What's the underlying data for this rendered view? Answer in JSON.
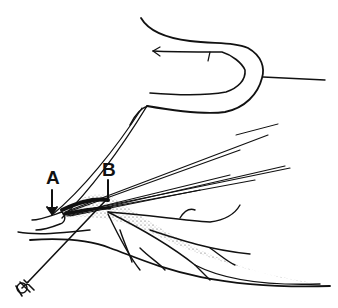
{
  "figure": {
    "type": "anatomical line illustration",
    "labels": {
      "a": "A",
      "b": "B"
    },
    "colors": {
      "ink": "#111111",
      "background": "#ffffff",
      "stipple": "#555555"
    }
  }
}
